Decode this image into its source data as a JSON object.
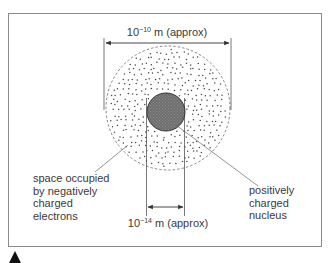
{
  "diagram": {
    "atom_diameter_label": {
      "base": "10",
      "exponent": "−10",
      "unit_text": " m (approx)"
    },
    "nucleus_diameter_label": {
      "base": "10",
      "exponent": "−14",
      "unit_text": " m (approx)"
    },
    "left_annotation": [
      "space occupied",
      "by negatively",
      "charged",
      "electrons"
    ],
    "right_annotation": [
      "positively",
      "charged",
      "nucleus"
    ]
  },
  "colors": {
    "frame": "#8a8a8a",
    "line": "#555555",
    "nucleus_fill": "#6e6e6e",
    "dots": "#444444",
    "text": "#3a3a3a",
    "marker": "#111111"
  },
  "icons": {
    "corner_marker": "triangle-up-icon"
  }
}
